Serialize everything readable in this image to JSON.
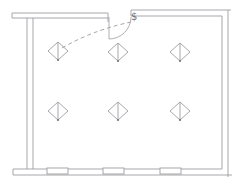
{
  "meta": {
    "canvas": {
      "width": 241,
      "height": 186
    }
  },
  "drawing": {
    "background": "#ffffff",
    "line_color": "#9d9da1",
    "dark_line_color": "#76767a",
    "wall_stroke_width": 0.9,
    "symbol_stroke_width": 0.9
  },
  "walls": {
    "segments": [
      {
        "x1": 12,
        "y1": 13,
        "x2": 108,
        "y2": 13
      },
      {
        "x1": 12,
        "y1": 13,
        "x2": 12,
        "y2": 18
      },
      {
        "x1": 12,
        "y1": 18,
        "x2": 108,
        "y2": 18
      },
      {
        "x1": 108,
        "y1": 13,
        "x2": 108,
        "y2": 22
      },
      {
        "x1": 131,
        "y1": 10,
        "x2": 231,
        "y2": 10
      },
      {
        "x1": 131,
        "y1": 16,
        "x2": 222,
        "y2": 16
      },
      {
        "x1": 131,
        "y1": 10,
        "x2": 131,
        "y2": 16
      },
      {
        "x1": 228,
        "y1": 10,
        "x2": 228,
        "y2": 177
      },
      {
        "x1": 222,
        "y1": 16,
        "x2": 222,
        "y2": 169
      },
      {
        "x1": 13,
        "y1": 169,
        "x2": 222,
        "y2": 169
      },
      {
        "x1": 13,
        "y1": 175,
        "x2": 232,
        "y2": 175
      },
      {
        "x1": 13,
        "y1": 169,
        "x2": 13,
        "y2": 175
      },
      {
        "x1": 27,
        "y1": 18,
        "x2": 27,
        "y2": 169
      },
      {
        "x1": 33,
        "y1": 18,
        "x2": 33,
        "y2": 169
      }
    ]
  },
  "windows": [
    {
      "x": 47,
      "y": 168,
      "w": 21,
      "h": 6
    },
    {
      "x": 103,
      "y": 168,
      "w": 21,
      "h": 6
    },
    {
      "x": 160,
      "y": 168,
      "w": 21,
      "h": 6
    }
  ],
  "door": {
    "leaf": {
      "x1": 109,
      "y1": 17,
      "x2": 109,
      "y2": 39
    },
    "arc_path": "M 131 17 A 22 22 0 0 1 109 39"
  },
  "switch": {
    "symbol": "$",
    "x": 131,
    "y": 20
  },
  "wire": {
    "path": "M 131 22 C 112 26 88 33 62 48",
    "dasharray": "4 3"
  },
  "fixtures": {
    "symbol_name": "ceiling-light-diamond",
    "rx": 10,
    "ry": 9,
    "positions": [
      {
        "x": 58,
        "y": 51
      },
      {
        "x": 118,
        "y": 52
      },
      {
        "x": 180,
        "y": 52
      },
      {
        "x": 58,
        "y": 111
      },
      {
        "x": 118,
        "y": 111
      },
      {
        "x": 180,
        "y": 111
      }
    ]
  }
}
